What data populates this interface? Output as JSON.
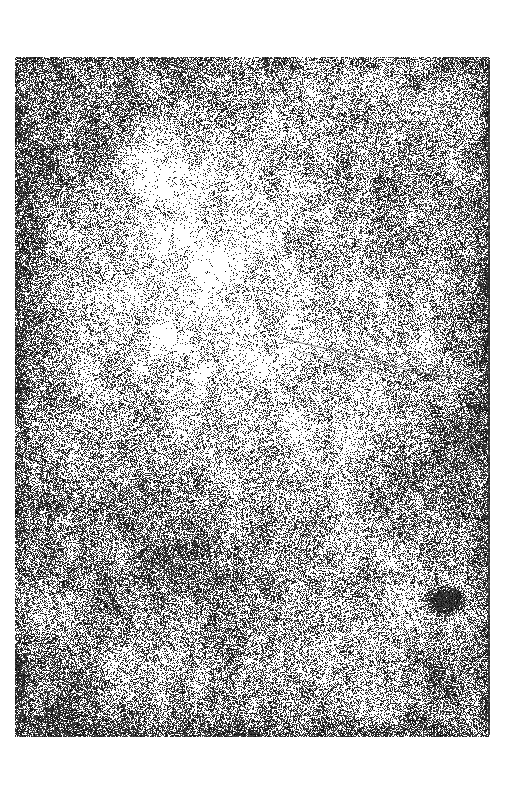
{
  "document": {
    "title": "Grunge Texture Scan",
    "kind": "scanned-texture-plate",
    "canvas_width": 505,
    "canvas_height": 804,
    "paper_color": "#ffffff",
    "ink_color": "#1a1a1a"
  },
  "plate": {
    "name": "speckled-grain-plate",
    "x": 15,
    "y": 57,
    "width": 475,
    "height": 680,
    "base_color": "#ffffff",
    "speckle_color": "#141414",
    "overall_coverage": 0.34,
    "description": "Dense black dust-and-scratches speckle over white, unevenly lit"
  },
  "density_field": {
    "note": "Soft low-frequency darkening blobs in plate-local coordinates (0-1 of plate box)",
    "blobs": [
      {
        "name": "upper-left-smudge",
        "cx": 0.09,
        "cy": 0.12,
        "rx": 0.22,
        "ry": 0.16,
        "strength": 0.46
      },
      {
        "name": "top-edge-shade",
        "cx": 0.32,
        "cy": 0.04,
        "rx": 0.4,
        "ry": 0.09,
        "strength": 0.3
      },
      {
        "name": "left-edge-band",
        "cx": 0.02,
        "cy": 0.45,
        "rx": 0.13,
        "ry": 0.55,
        "strength": 0.42
      },
      {
        "name": "right-edge-band",
        "cx": 0.98,
        "cy": 0.4,
        "rx": 0.12,
        "ry": 0.62,
        "strength": 0.4
      },
      {
        "name": "right-upper-shade",
        "cx": 0.78,
        "cy": 0.22,
        "rx": 0.22,
        "ry": 0.22,
        "strength": 0.26
      },
      {
        "name": "diagonal-sweep-lower",
        "cx": 0.22,
        "cy": 0.7,
        "rx": 0.3,
        "ry": 0.26,
        "strength": 0.4
      },
      {
        "name": "center-lower-shade",
        "cx": 0.48,
        "cy": 0.78,
        "rx": 0.34,
        "ry": 0.22,
        "strength": 0.34
      },
      {
        "name": "bottom-left-corner",
        "cx": 0.04,
        "cy": 0.96,
        "rx": 0.22,
        "ry": 0.16,
        "strength": 0.62
      },
      {
        "name": "bottom-edge-shade",
        "cx": 0.46,
        "cy": 0.99,
        "rx": 0.46,
        "ry": 0.1,
        "strength": 0.42
      },
      {
        "name": "bottom-right-corner",
        "cx": 0.92,
        "cy": 0.94,
        "rx": 0.18,
        "ry": 0.14,
        "strength": 0.5
      },
      {
        "name": "right-mid-shade",
        "cx": 0.88,
        "cy": 0.62,
        "rx": 0.18,
        "ry": 0.2,
        "strength": 0.36
      }
    ],
    "light_blobs": [
      {
        "name": "center-highlight",
        "cx": 0.4,
        "cy": 0.33,
        "rx": 0.3,
        "ry": 0.26,
        "strength": 0.4
      },
      {
        "name": "upper-center-highlight",
        "cx": 0.3,
        "cy": 0.18,
        "rx": 0.18,
        "ry": 0.13,
        "strength": 0.26
      },
      {
        "name": "mid-right-highlight",
        "cx": 0.62,
        "cy": 0.52,
        "rx": 0.17,
        "ry": 0.17,
        "strength": 0.22
      }
    ]
  },
  "features": {
    "dark_blob": {
      "name": "dark-ink-blob",
      "cx": 445,
      "cy": 600,
      "rx": 17,
      "ry": 13,
      "color": "#0d0d0d"
    },
    "right_edge_line": {
      "name": "right-edge-dark-line",
      "x": 488,
      "y_top": 60,
      "y_bottom": 735,
      "width": 2,
      "color": "#2b2b2b",
      "opacity": 0.78
    },
    "scratch": {
      "name": "curved-hairline-scratch",
      "color": "#5a5a5a",
      "stroke_width": 0.9,
      "path": "M 283 339 Q 345 352 392 366 Q 425 374 452 377"
    },
    "scratch_secondary": {
      "name": "curved-hairline-scratch-lower",
      "color": "#6e6e6e",
      "stroke_width": 0.7,
      "path": "M 300 352 Q 352 366 398 378"
    }
  }
}
